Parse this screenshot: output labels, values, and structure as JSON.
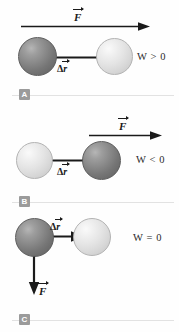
{
  "figure": {
    "colors": {
      "ball_dark": "#7d7d7d",
      "ball_light": "#e0e0e0",
      "arrow": "#1a1a1a",
      "divider": "#e2e2e2",
      "key_box": "#9b9b9b",
      "background": "#fefefe"
    },
    "labels": {
      "force": "F",
      "displacement_delta": "Δ",
      "displacement_r": "r"
    },
    "panels": [
      {
        "key": "A",
        "work_text": "W > 0",
        "force_label": "F",
        "displacement_label": "r",
        "force_direction": "right",
        "displacement_direction": "right",
        "start_ball": "dark",
        "end_ball": "light"
      },
      {
        "key": "B",
        "work_text": "W < 0",
        "force_label": "F",
        "displacement_label": "r",
        "force_direction": "right",
        "displacement_direction": "left",
        "start_ball": "dark",
        "end_ball": "light"
      },
      {
        "key": "C",
        "work_text": "W = 0",
        "force_label": "F",
        "displacement_label": "r",
        "force_direction": "down",
        "displacement_direction": "right",
        "start_ball": "dark",
        "end_ball": "light"
      }
    ]
  }
}
